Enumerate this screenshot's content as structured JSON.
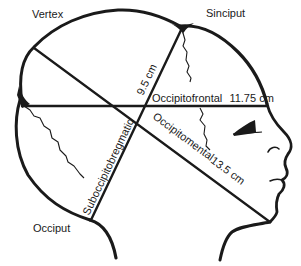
{
  "diagram": {
    "landmarks": {
      "vertex": "Vertex",
      "sinciput": "Sinciput",
      "occiput": "Occiput"
    },
    "diameters": [
      {
        "id": "occipitofrontal",
        "name": "Occipitofrontal",
        "value": "11.75 cm"
      },
      {
        "id": "occipitomental",
        "name": "Occipitomental",
        "value": "13.5 cm"
      },
      {
        "id": "suboccipitobregmatic",
        "name": "Suboccipitobregmatic",
        "value": "9.5 cm"
      }
    ],
    "colors": {
      "ink": "#1a1a1a",
      "background": "#ffffff"
    }
  }
}
